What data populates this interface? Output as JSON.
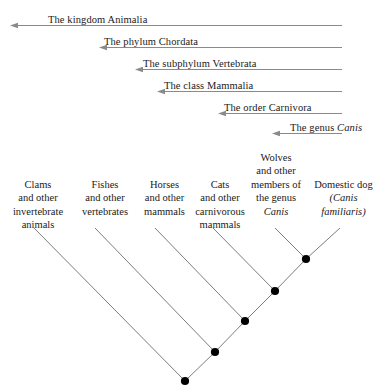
{
  "figure": {
    "type": "cladogram",
    "title": "",
    "background_color": "#ffffff",
    "text_color": "#1a1a1a",
    "arrow_color": "#8a8a8a",
    "branch_color": "#6d6d6d",
    "node_color": "#000000"
  },
  "ranks": [
    {
      "id": "kingdom",
      "label_pre": "The kingdom Animalia",
      "label_italic": "",
      "label_post": "",
      "label_x": 48,
      "row_y": 6,
      "arrow_x1": 342,
      "arrow_x2": 10
    },
    {
      "id": "phylum",
      "label_pre": "The phylum Chordata",
      "label_italic": "",
      "label_post": "",
      "label_x": 104,
      "row_y": 28,
      "arrow_x1": 342,
      "arrow_x2": 99
    },
    {
      "id": "subphylum",
      "label_pre": "The subphylum Vertebrata",
      "label_italic": "",
      "label_post": "",
      "label_x": 143,
      "row_y": 50,
      "arrow_x1": 342,
      "arrow_x2": 135
    },
    {
      "id": "class",
      "label_pre": "The class Mammalia",
      "label_italic": "",
      "label_post": "",
      "label_x": 164,
      "row_y": 72,
      "arrow_x1": 342,
      "arrow_x2": 157
    },
    {
      "id": "order",
      "label_pre": "The order Carnivora",
      "label_italic": "",
      "label_post": "",
      "label_x": 224,
      "row_y": 94,
      "arrow_x1": 342,
      "arrow_x2": 218
    },
    {
      "id": "genus",
      "label_pre": "The genus ",
      "label_italic": "Canis",
      "label_post": "",
      "label_x": 290,
      "row_y": 114,
      "arrow_x1": 342,
      "arrow_x2": 272
    }
  ],
  "taxa": [
    {
      "id": "clams",
      "lines": [
        "Clams",
        "and other",
        "invertebrate",
        "animals"
      ],
      "italic_lines": [],
      "box_left": 2,
      "box_top": 178,
      "box_width": 72
    },
    {
      "id": "fishes",
      "lines": [
        "Fishes",
        "and other",
        "vertebrates"
      ],
      "italic_lines": [],
      "box_left": 71,
      "box_top": 178,
      "box_width": 68
    },
    {
      "id": "horses",
      "lines": [
        "Horses",
        "and other",
        "mammals"
      ],
      "italic_lines": [],
      "box_left": 132,
      "box_top": 178,
      "box_width": 65
    },
    {
      "id": "cats",
      "lines": [
        "Cats",
        "and other",
        "carnivorous",
        "mammals"
      ],
      "italic_lines": [],
      "box_left": 185,
      "box_top": 178,
      "box_width": 70
    },
    {
      "id": "wolves",
      "lines": [
        "Wolves",
        "and other",
        "members of",
        "the genus",
        "Canis"
      ],
      "italic_lines": [
        4
      ],
      "box_left": 240,
      "box_top": 151,
      "box_width": 72
    },
    {
      "id": "domestic-dog",
      "lines": [
        "Domestic dog",
        "(Canis",
        "familiaris)"
      ],
      "italic_lines": [
        1,
        2
      ],
      "box_left": 305,
      "box_top": 178,
      "box_width": 77
    }
  ],
  "chart_data": {
    "type": "diagram",
    "nodes": [
      {
        "id": "n1",
        "x": 185,
        "y": 381,
        "label": "animalia-node"
      },
      {
        "id": "n2",
        "x": 215,
        "y": 352,
        "label": "chordata-node"
      },
      {
        "id": "n3",
        "x": 245,
        "y": 321,
        "label": "vertebrata-node"
      },
      {
        "id": "n4",
        "x": 275,
        "y": 291,
        "label": "mammalia-node"
      },
      {
        "id": "n5",
        "x": 306,
        "y": 259,
        "label": "canis-node"
      }
    ],
    "tips": [
      {
        "id": "t-clams",
        "x": 34,
        "y": 228,
        "connects": "n1"
      },
      {
        "id": "t-fishes",
        "x": 95,
        "y": 228,
        "connects": "n2"
      },
      {
        "id": "t-horses",
        "x": 155,
        "y": 228,
        "connects": "n3"
      },
      {
        "id": "t-cats",
        "x": 213,
        "y": 228,
        "connects": "n4"
      },
      {
        "id": "t-wolves",
        "x": 275,
        "y": 228,
        "connects": "n5"
      },
      {
        "id": "t-dog",
        "x": 340,
        "y": 228,
        "connects": "n5"
      }
    ],
    "edges": [
      [
        "t-clams",
        "n1"
      ],
      [
        "n1",
        "n2"
      ],
      [
        "t-fishes",
        "n2"
      ],
      [
        "n2",
        "n3"
      ],
      [
        "t-horses",
        "n3"
      ],
      [
        "n3",
        "n4"
      ],
      [
        "t-cats",
        "n4"
      ],
      [
        "n4",
        "n5"
      ],
      [
        "t-wolves",
        "n5"
      ],
      [
        "t-dog",
        "n5"
      ]
    ]
  }
}
